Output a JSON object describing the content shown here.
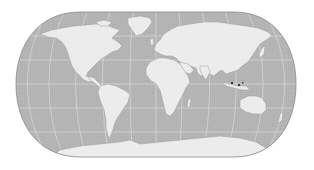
{
  "map": {
    "projection": "eckert-iv-like",
    "colors": {
      "background": "#ffffff",
      "ocean": "#b4b4b4",
      "land": "#ececec",
      "graticule": "#dadada",
      "outline": "#8a8a8a",
      "coast": "#9a9a9a",
      "highlight": "#3a3a3a"
    },
    "bounds": {
      "left": 16,
      "right": 296,
      "top": 12,
      "bottom": 157
    },
    "graticule": {
      "meridians_deg": [
        -150,
        -120,
        -90,
        -60,
        -30,
        0,
        30,
        60,
        90,
        120,
        150
      ],
      "parallels_deg": [
        -60,
        -30,
        0,
        30,
        60
      ]
    },
    "continents": [
      "north-america",
      "greenland",
      "south-america",
      "europe",
      "africa",
      "asia",
      "australia",
      "antarctica",
      "indonesia",
      "madagascar",
      "japan",
      "uk",
      "new-zealand"
    ]
  }
}
